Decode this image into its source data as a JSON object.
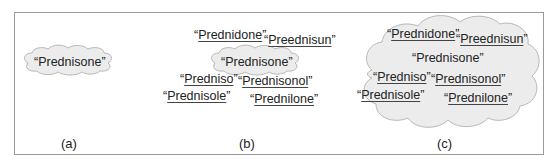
{
  "panels": [
    {
      "id": "a",
      "label": "(a)",
      "center_word": "“Prednisone”",
      "variants": []
    },
    {
      "id": "b",
      "label": "(b)",
      "center_word": "“Prednisone”",
      "variants": [
        {
          "open": "“",
          "text": "Prednidone",
          "close": "”"
        },
        {
          "open": "“",
          "text": "Preednisun",
          "close": "”"
        },
        {
          "open": "“",
          "text": "Predniso",
          "close": "”"
        },
        {
          "open": "“",
          "text": "Prednisonol",
          "close": "”"
        },
        {
          "open": "“",
          "text": "Prednisole",
          "close": "”"
        },
        {
          "open": "“",
          "text": "Prednilone",
          "close": "”"
        }
      ]
    },
    {
      "id": "c",
      "label": "(c)",
      "center_word": "“Prednisone”",
      "variants": [
        {
          "open": "“",
          "text": "Prednidone",
          "close": "”"
        },
        {
          "open": "“",
          "text": "Preednisun",
          "close": "”"
        },
        {
          "open": "“",
          "text": "Predniso",
          "close": "”"
        },
        {
          "open": "“",
          "text": "Prednisonol",
          "close": "”"
        },
        {
          "open": "“",
          "text": "Prednisole",
          "close": "”"
        },
        {
          "open": "“",
          "text": "Prednilone",
          "close": "”"
        }
      ]
    }
  ],
  "colors": {
    "cloud_fill": "#ececec",
    "cloud_stroke": "#b8b8b8",
    "frame": "#9a9a9a",
    "text": "#222222"
  }
}
